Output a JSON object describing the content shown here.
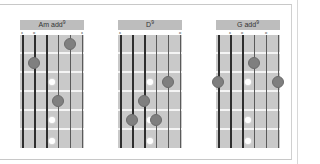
{
  "colors": {
    "fretboard": "#c9c9c9",
    "title_bar": "#bdbdbd",
    "finger_dot": "#7f7f7f",
    "fret_wire": "#f4f4f4",
    "inlay": "#ffffff"
  },
  "chords": [
    {
      "name": "Am add",
      "superscript": "9",
      "string_markers": [
        "x",
        "o",
        "",
        "",
        "",
        "x"
      ],
      "fingers": [
        {
          "string": 5,
          "fret": 1
        },
        {
          "string": 2,
          "fret": 2
        },
        {
          "string": 4,
          "fret": 4
        }
      ]
    },
    {
      "name": "D",
      "superscript": "9",
      "string_markers": [
        "x",
        "",
        "",
        "",
        "",
        "o"
      ],
      "fingers": [
        {
          "string": 5,
          "fret": 3
        },
        {
          "string": 3,
          "fret": 4
        },
        {
          "string": 2,
          "fret": 5
        },
        {
          "string": 4,
          "fret": 5
        }
      ]
    },
    {
      "name": "G add",
      "superscript": "9",
      "string_markers": [
        "",
        "x",
        "o",
        "",
        "o",
        ""
      ],
      "fingers": [
        {
          "string": 4,
          "fret": 2
        },
        {
          "string": 1,
          "fret": 3
        },
        {
          "string": 6,
          "fret": 3
        }
      ]
    }
  ],
  "inlay_frets": [
    3,
    5,
    7
  ]
}
